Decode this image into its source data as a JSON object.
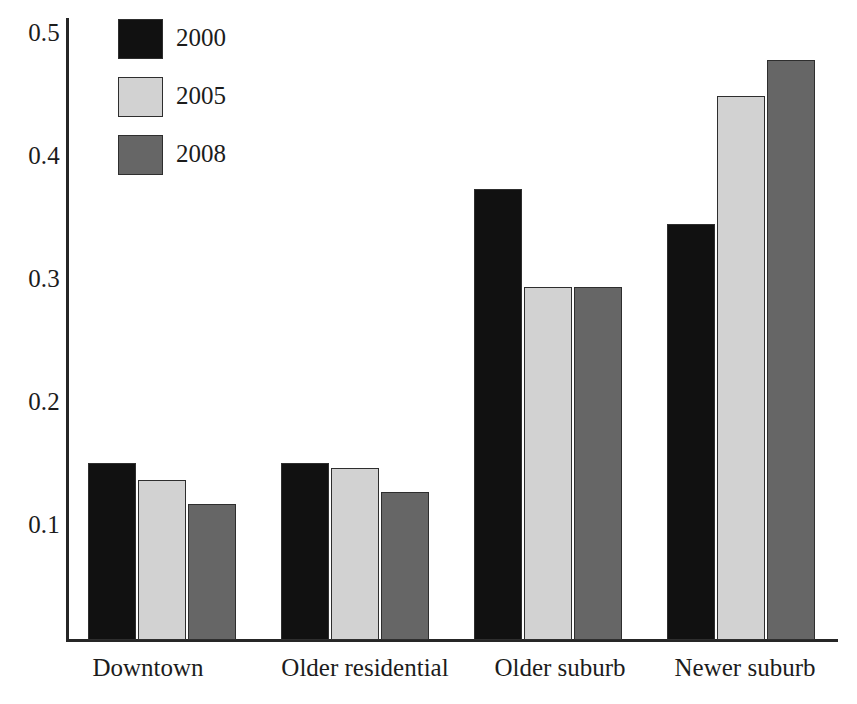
{
  "chart_data": {
    "type": "bar",
    "title": "",
    "subtitle": "",
    "xlabel": "",
    "ylabel": "",
    "categories": [
      "Downtown",
      "Older residential",
      "Older suburb",
      "Newer suburb"
    ],
    "series": [
      {
        "name": "2000",
        "color": "#111111",
        "values": [
          0.148,
          0.148,
          0.377,
          0.348
        ]
      },
      {
        "name": "2005",
        "color": "#d2d2d2",
        "values": [
          0.134,
          0.144,
          0.295,
          0.455
        ]
      },
      {
        "name": "2008",
        "color": "#666666",
        "values": [
          0.114,
          0.124,
          0.295,
          0.485
        ]
      }
    ],
    "ylim": [
      0.0,
      0.52
    ],
    "yticks": [
      0.5,
      0.4,
      0.3,
      0.2,
      0.1
    ],
    "ytick_labels": [
      "0.5",
      "0.4",
      "0.3",
      "0.2",
      "0.1"
    ],
    "grid": false,
    "legend_position": "top-left",
    "axis_color": "#262626",
    "bar_edge_color": "#2e2e2e",
    "background": "#ffffff"
  },
  "legend": {
    "entries": [
      {
        "label": "2000",
        "color": "#111111"
      },
      {
        "label": "2005",
        "color": "#d2d2d2"
      },
      {
        "label": "2008",
        "color": "#666666"
      }
    ]
  },
  "axis": {
    "y_tick_labels": [
      "0.5",
      "0.4",
      "0.3",
      "0.2",
      "0.1"
    ],
    "x_tick_labels": [
      "Downtown",
      "Older residential",
      "Older suburb",
      "Newer suburb"
    ]
  }
}
